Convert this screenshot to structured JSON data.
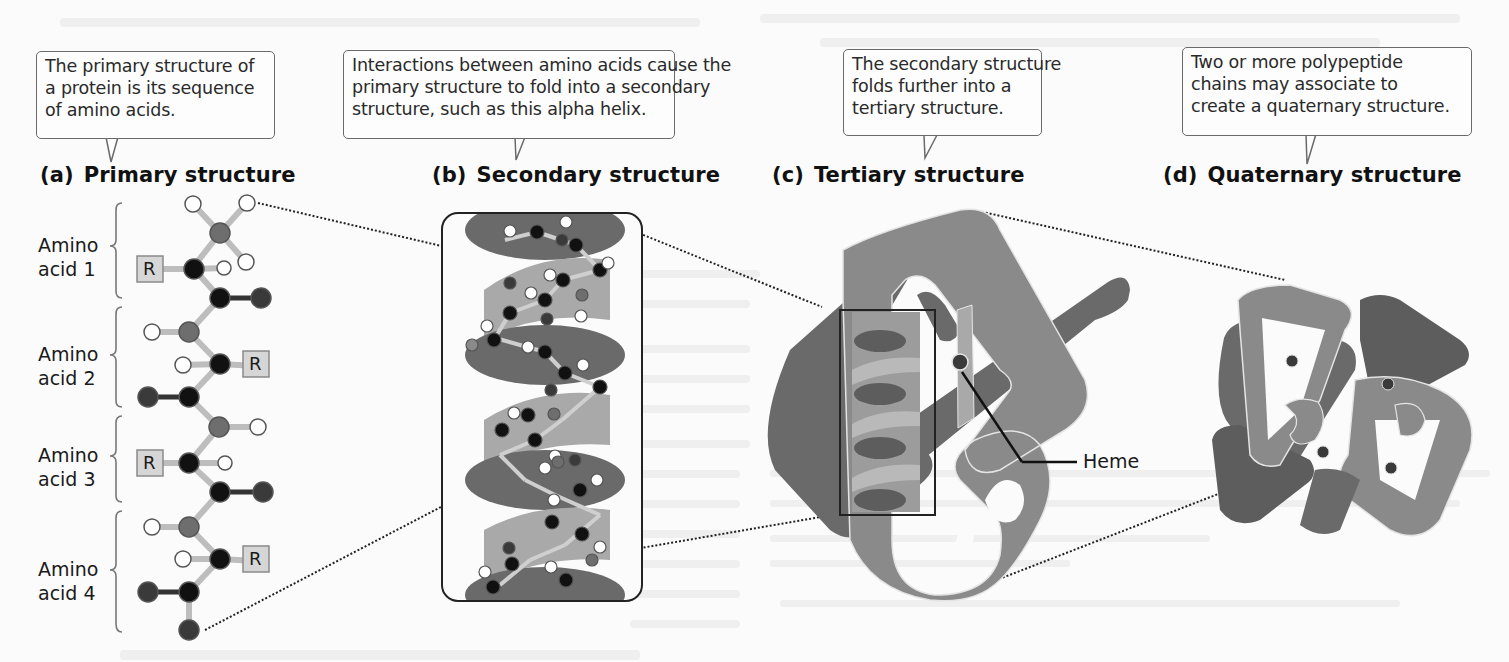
{
  "figure": {
    "panels": [
      {
        "id": "a",
        "letter": "(a)",
        "title": "Primary structure",
        "callout": [
          "The primary structure of",
          "a protein is its sequence",
          "of amino acids."
        ]
      },
      {
        "id": "b",
        "letter": "(b)",
        "title": "Secondary structure",
        "callout": [
          "Interactions between amino acids cause the",
          "primary structure to fold into a secondary",
          "structure, such as this alpha helix."
        ]
      },
      {
        "id": "c",
        "letter": "(c)",
        "title": "Tertiary structure",
        "callout": [
          "The secondary structure",
          "folds further into a",
          "tertiary structure."
        ]
      },
      {
        "id": "d",
        "letter": "(d)",
        "title": "Quaternary structure",
        "callout": [
          "Two or more polypeptide",
          "chains may associate to",
          "create a quaternary structure."
        ]
      }
    ],
    "amino_acids": [
      {
        "line1": "Amino",
        "line2": "acid 1"
      },
      {
        "line1": "Amino",
        "line2": "acid 2"
      },
      {
        "line1": "Amino",
        "line2": "acid 3"
      },
      {
        "line1": "Amino",
        "line2": "acid 4"
      }
    ],
    "r_group_label": "R",
    "heme_label": "Heme",
    "colors": {
      "carbon": "#111111",
      "nitrogen": "#6e6e6e",
      "oxygen": "#3a3a3a",
      "hydrogen": "#ffffff",
      "bond": "#bdbdbd",
      "ribbon_light": "#a9a9a9",
      "ribbon_mid": "#8a8a8a",
      "ribbon_dark": "#5d5d5d",
      "r_box": "#d6d6d6"
    }
  }
}
